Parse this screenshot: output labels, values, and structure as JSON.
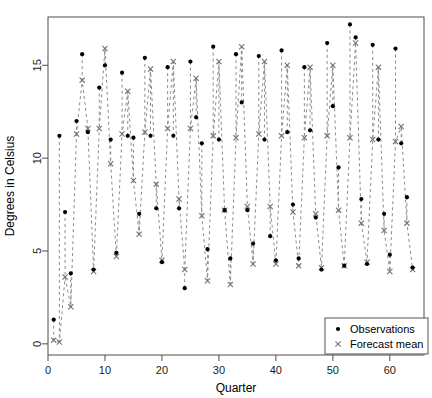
{
  "chart_data": {
    "type": "scatter",
    "title": "",
    "xlabel": "Quarter",
    "ylabel": "Degrees in Celsius",
    "xlim": [
      0,
      66
    ],
    "ylim": [
      -0.6,
      17.6
    ],
    "xticks": [
      0,
      10,
      20,
      30,
      40,
      50,
      60
    ],
    "xticklabels": [
      "0",
      "10",
      "20",
      "30",
      "40",
      "50",
      "60"
    ],
    "yticks": [
      0,
      5,
      10,
      15
    ],
    "yticklabels": [
      "0",
      "5",
      "10",
      "15"
    ],
    "grid": false,
    "legend_position": "bottom-right",
    "x": [
      1,
      2,
      3,
      4,
      5,
      6,
      7,
      8,
      9,
      10,
      11,
      12,
      13,
      14,
      15,
      16,
      17,
      18,
      19,
      20,
      21,
      22,
      23,
      24,
      25,
      26,
      27,
      28,
      29,
      30,
      31,
      32,
      33,
      34,
      35,
      36,
      37,
      38,
      39,
      40,
      41,
      42,
      43,
      44,
      45,
      46,
      47,
      48,
      49,
      50,
      51,
      52,
      53,
      54,
      55,
      56,
      57,
      58,
      59,
      60,
      61,
      62,
      63,
      64
    ],
    "series": [
      {
        "name": "Observations",
        "marker": "filled-circle",
        "color": "#000000",
        "values": [
          1.3,
          11.2,
          7.1,
          3.8,
          12.0,
          15.6,
          11.4,
          4.0,
          13.8,
          15.0,
          11.0,
          4.9,
          14.6,
          11.2,
          11.1,
          7.0,
          15.4,
          11.2,
          7.3,
          4.4,
          14.9,
          11.2,
          7.3,
          3.0,
          15.2,
          12.2,
          10.8,
          5.1,
          16.0,
          11.0,
          7.2,
          4.6,
          15.6,
          13.0,
          7.2,
          5.4,
          15.5,
          11.0,
          5.8,
          4.5,
          15.8,
          11.4,
          7.5,
          4.6,
          14.9,
          11.5,
          6.8,
          4.0,
          16.2,
          12.8,
          9.5,
          4.2,
          17.2,
          16.5,
          7.8,
          4.3,
          16.1,
          11.0,
          7.0,
          4.8,
          15.9,
          10.8,
          7.9,
          4.1
        ]
      },
      {
        "name": "Forecast mean",
        "marker": "cross",
        "color": "#737373",
        "values": [
          0.2,
          0.1,
          3.6,
          2.0,
          11.3,
          14.2,
          11.6,
          3.9,
          11.6,
          15.9,
          9.7,
          4.7,
          11.3,
          13.6,
          8.8,
          5.9,
          11.4,
          14.8,
          8.6,
          4.5,
          11.6,
          15.2,
          7.8,
          4.0,
          11.6,
          14.3,
          6.9,
          3.4,
          11.2,
          15.2,
          7.2,
          3.2,
          11.1,
          16.0,
          7.4,
          4.3,
          11.3,
          15.2,
          7.4,
          4.3,
          11.2,
          15.0,
          7.1,
          4.2,
          11.1,
          14.9,
          7.0,
          4.1,
          11.2,
          15.0,
          7.2,
          4.2,
          11.1,
          16.2,
          6.5,
          4.4,
          11.0,
          14.9,
          6.1,
          3.9,
          10.9,
          11.7,
          6.5,
          4.0
        ]
      }
    ],
    "links": {
      "description": "dashed grey segments join each observation to its forecast mean within quarterly cycles",
      "style": "dashed",
      "color": "#8c8c8c"
    }
  },
  "legend": {
    "entries": [
      {
        "label": "Observations",
        "marker": "filled-circle"
      },
      {
        "label": "Forecast mean",
        "marker": "cross"
      }
    ]
  },
  "axes": {
    "x_title": "Quarter",
    "y_title": "Degrees in Celsius"
  }
}
